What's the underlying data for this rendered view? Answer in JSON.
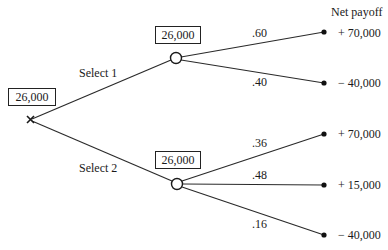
{
  "header": {
    "payoff_column_title": "Net payoff"
  },
  "root": {
    "type": "decision",
    "expected_value": "26,000"
  },
  "branches": [
    {
      "label": "Select 1",
      "chance_node": {
        "expected_value": "26,000",
        "outcomes": [
          {
            "probability": ".60",
            "payoff": "+ 70,000"
          },
          {
            "probability": ".40",
            "payoff": "− 40,000"
          }
        ]
      }
    },
    {
      "label": "Select 2",
      "chance_node": {
        "expected_value": "26,000",
        "outcomes": [
          {
            "probability": ".36",
            "payoff": "+ 70,000"
          },
          {
            "probability": ".48",
            "payoff": "+ 15,000"
          },
          {
            "probability": ".16",
            "payoff": "− 40,000"
          }
        ]
      }
    }
  ],
  "colors": {
    "line": "#2a2a2a",
    "background": "#ffffff"
  }
}
